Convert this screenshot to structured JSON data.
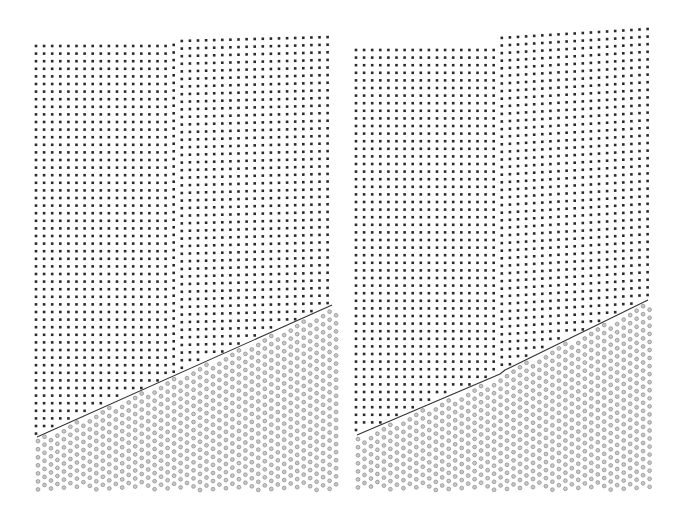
{
  "figure": {
    "description": "Two side-by-side atomistic lattice snapshots showing an upper crystal of dark atoms (vertical columns) meeting a lower crystal of gray hollow atoms (diagonal rows) across an inclined interface",
    "colors": {
      "background": "#ffffff",
      "upper_atom": "#2a2a2a",
      "lower_atom_fill": "#c8c8c8",
      "lower_atom_stroke": "#8a8a8a",
      "interface_line": "#333333"
    },
    "spacing": {
      "dx": 8.1,
      "dy": 7.6,
      "lower_dx": 7.2,
      "lower_dy": 7.0
    }
  },
  "panels": [
    {
      "id": "left",
      "x_min": 36,
      "x_max": 332,
      "top_edge": [
        [
          36,
          46
        ],
        [
          172,
          46
        ],
        [
          180,
          41
        ],
        [
          332,
          37
        ]
      ],
      "interface": [
        [
          37,
          437
        ],
        [
          332,
          305
        ]
      ],
      "lower_bottom": 490,
      "lower_right": 340,
      "column_tilt": 0.0
    },
    {
      "id": "right",
      "x_min": 356,
      "x_max": 648,
      "top_edge": [
        [
          356,
          50
        ],
        [
          495,
          50
        ],
        [
          500,
          38
        ],
        [
          648,
          29
        ]
      ],
      "interface": [
        [
          357,
          435
        ],
        [
          500,
          374
        ],
        [
          505,
          370
        ],
        [
          648,
          300
        ]
      ],
      "lower_bottom": 490,
      "lower_right": 656,
      "column_tilt": 0.0
    }
  ]
}
